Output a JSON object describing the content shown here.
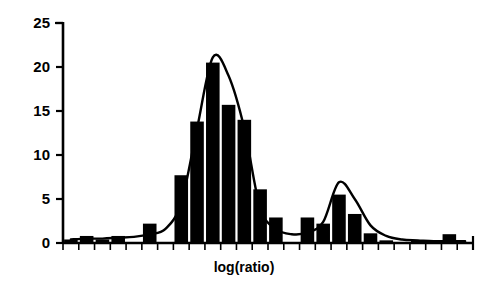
{
  "chart_data": {
    "type": "bar",
    "title": "",
    "subtitle": "",
    "xlabel": "log(ratio)",
    "ylabel": "",
    "ylim": [
      0,
      25
    ],
    "ytick_labels": [
      "0",
      "5",
      "10",
      "15",
      "20",
      "25"
    ],
    "ytick_values": [
      0,
      5,
      10,
      15,
      20,
      25
    ],
    "xtick_labels": [],
    "grid": false,
    "legend": false,
    "bin_count": 26,
    "categories": [
      "b1",
      "b2",
      "b3",
      "b4",
      "b5",
      "b6",
      "b7",
      "b8",
      "b9",
      "b10",
      "b11",
      "b12",
      "b13",
      "b14",
      "b15",
      "b16",
      "b17",
      "b18",
      "b19",
      "b20",
      "b21",
      "b22",
      "b23",
      "b24",
      "b25",
      "b26"
    ],
    "values": [
      0.4,
      0.8,
      0.4,
      0.8,
      0.0,
      2.2,
      0.0,
      7.7,
      13.8,
      20.5,
      15.7,
      14.0,
      6.1,
      2.9,
      0.0,
      2.9,
      2.2,
      5.5,
      3.3,
      1.1,
      0.3,
      0.0,
      0.3,
      0.0,
      1.0,
      0.0
    ],
    "series": [
      {
        "name": "histogram",
        "values": [
          0.4,
          0.8,
          0.4,
          0.8,
          0.0,
          2.2,
          0.0,
          7.7,
          13.8,
          20.5,
          15.7,
          14.0,
          6.1,
          2.9,
          0.0,
          2.9,
          2.2,
          5.5,
          3.3,
          1.1,
          0.3,
          0.0,
          0.3,
          0.0,
          1.0,
          0.0
        ]
      },
      {
        "name": "fitted-density-curve",
        "values": [
          0.4,
          0.5,
          0.5,
          0.6,
          0.7,
          1.0,
          1.6,
          4.6,
          13.0,
          21.1,
          19.0,
          13.0,
          4.0,
          1.6,
          1.0,
          1.2,
          2.4,
          6.9,
          5.0,
          2.0,
          0.8,
          0.4,
          0.3,
          0.2,
          0.2,
          0.2
        ]
      }
    ],
    "annotations": []
  },
  "axes": {
    "y_axis_name": "y-axis",
    "x_axis_name": "x-axis",
    "x_minor_tick_count": 26
  }
}
